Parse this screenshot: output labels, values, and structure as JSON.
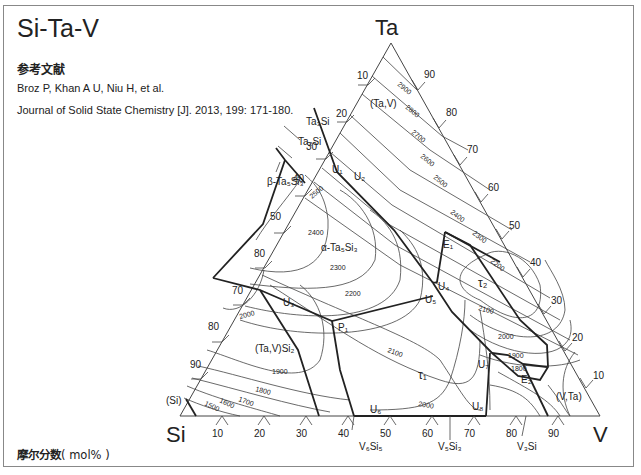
{
  "title": "Si-Ta-V",
  "reference": {
    "heading": "参考文献",
    "authors": "Broz P,  Khan A U,  Niu H,  et al.",
    "citation": "Journal of Solid State Chemistry [J]. 2013,  199:  171-180."
  },
  "units": {
    "label": "摩尔分数",
    "unit": "( mol% )"
  },
  "corners": {
    "top": "Ta",
    "left": "Si",
    "right": "V"
  },
  "axes": {
    "left_ticks": [
      "10",
      "20",
      "30",
      "40",
      "50",
      "80",
      "70",
      "80",
      "90"
    ],
    "right_ticks": [
      "90",
      "80",
      "70",
      "60",
      "50",
      "40",
      "30",
      "20",
      "10"
    ],
    "bottom_ticks": [
      "10",
      "20",
      "30",
      "40",
      "50",
      "60",
      "70",
      "80",
      "90"
    ]
  },
  "phases": {
    "ta_v": "(Ta,V)",
    "ta3si": "Ta₃Si",
    "ta2si": "Ta₂Si",
    "beta": "β-Ta₅Si₃",
    "alpha": "α-Ta₅Si₃",
    "tavsi2": "(Ta,V)Si₂",
    "tau1": "τ₁",
    "tau2": "τ₂",
    "si": "(Si)",
    "v_ta": "(V,Ta)",
    "v6si5": "V₆Si₅",
    "v5si3": "V₅Si₃",
    "v3si": "V₃Si"
  },
  "points": {
    "U1": "U₁",
    "U2": "U₂",
    "U3": "U₃",
    "U4": "U₄",
    "U5": "U₅",
    "U6": "U₆",
    "U7": "U₇",
    "U8": "U₈",
    "E1": "E₁",
    "E2": "E₂",
    "P1": "P₁"
  },
  "isotherms": {
    "t2900": "2900",
    "t2800": "2800",
    "t2700": "2700",
    "t2600": "2600",
    "t2500": "2500",
    "t2400": "2400",
    "t2300": "2300",
    "t2200": "2200",
    "t2500b": "2500",
    "t2400b": "2400",
    "t2300b": "2300",
    "t2200b": "2200",
    "t2100": "2100",
    "t2100b": "2100",
    "t2000": "2000",
    "t2000b": "2000",
    "t2000c": "2000",
    "t1900": "1900",
    "t1900b": "1900",
    "t1800": "1800",
    "t1800b": "1800",
    "t1700": "1700",
    "t1600": "1600",
    "t1500": "1500"
  },
  "colors": {
    "line": "#222222",
    "thin": "#444444",
    "frame": "#888888"
  }
}
